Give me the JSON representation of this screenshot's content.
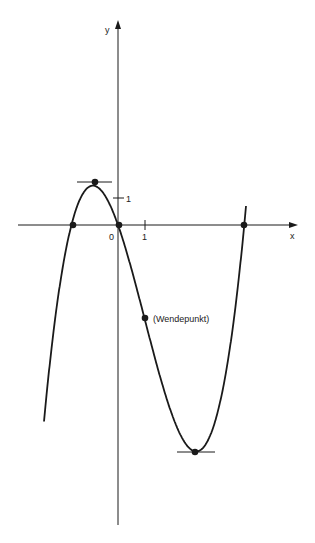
{
  "chart_data": {
    "type": "line",
    "title": "",
    "xlabel": "x",
    "ylabel": "y",
    "function": "cubic with roots at x≈-1.77, 0, 4.8",
    "roots": [
      -1.77,
      0,
      4.8
    ],
    "local_max": {
      "x": -0.92,
      "y": 1.45
    },
    "local_min": {
      "x": 2.9,
      "y": -7.8
    },
    "inflection_point": {
      "x": 1.0,
      "y": -3.2,
      "label": "(Wendepunkt)"
    },
    "tick_labels": {
      "origin": "0",
      "x_unit": "1",
      "y_unit": "1"
    },
    "marked_points": [
      {
        "x": -1.77,
        "y": 0
      },
      {
        "x": -0.92,
        "y": 1.45
      },
      {
        "x": 0,
        "y": 0
      },
      {
        "x": 1.0,
        "y": -3.2
      },
      {
        "x": 2.9,
        "y": -7.8
      },
      {
        "x": 4.8,
        "y": 0
      }
    ],
    "horizontal_tangents_at": [
      -0.92,
      2.9
    ],
    "xlim": [
      -3.9,
      6.8
    ],
    "ylim": [
      -10.3,
      5.9
    ],
    "grid": false,
    "legend": null
  },
  "labels": {
    "x_axis": "x",
    "y_axis": "y",
    "origin": "0",
    "x_tick": "1",
    "y_tick": "1",
    "inflection": "(Wendepunkt)"
  },
  "colors": {
    "ink": "#1a1a1a",
    "background": "#ffffff"
  }
}
